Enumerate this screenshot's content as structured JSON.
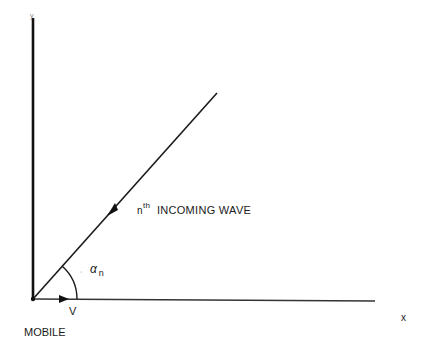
{
  "diagram": {
    "type": "geometry",
    "axes": {
      "x_label": "x",
      "y_label": "y"
    },
    "labels": {
      "wave_prefix": "n",
      "wave_superscript": "th",
      "wave_text": "INCOMING WAVE",
      "angle_symbol": "α",
      "angle_subscript": "n",
      "velocity": "V",
      "mobile": "MOBILE"
    },
    "geometry": {
      "origin": [
        33,
        299
      ],
      "y_axis_top": [
        33,
        18
      ],
      "x_axis_end": [
        375,
        301
      ],
      "wave_end": [
        217,
        93
      ],
      "wave_arrow_at": [
        112,
        210
      ],
      "velocity_arrow_at": [
        65,
        299
      ],
      "angle_arc_radius": 44
    },
    "colors": {
      "ink": "#1a1a1a",
      "background": "#ffffff"
    }
  }
}
